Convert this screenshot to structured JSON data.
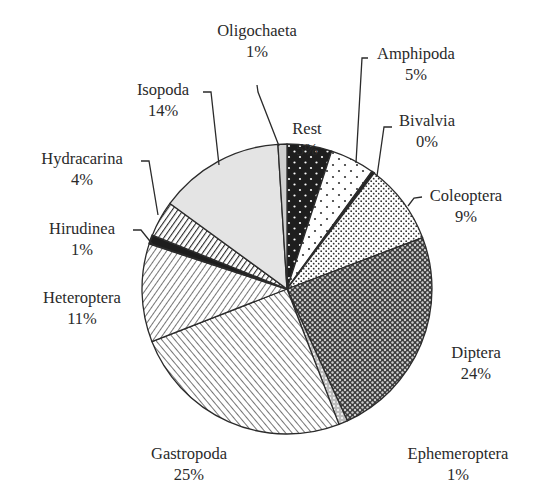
{
  "chart_data": {
    "type": "pie",
    "title": "",
    "start_angle_deg": 0,
    "direction": "clockwise",
    "center": [
      287,
      289
    ],
    "radius": 145,
    "slices": [
      {
        "name": "Rest",
        "value": 5,
        "label": "Rest",
        "pct": "5%",
        "pattern": "black-dots",
        "label_pos": [
          307,
          118
        ],
        "leader": []
      },
      {
        "name": "Amphipoda",
        "value": 5,
        "label": "Amphipoda",
        "pct": "5%",
        "pattern": "white-dots",
        "label_pos": [
          416,
          43
        ],
        "leader": [
          [
            368,
            58
          ],
          [
            362,
            58
          ],
          [
            356,
            163
          ]
        ]
      },
      {
        "name": "Bivalvia",
        "value": 0.3,
        "label": "Bivalvia",
        "pct": "0%",
        "pattern": "dark",
        "label_pos": [
          427,
          110
        ],
        "leader": [
          [
            392,
            127
          ],
          [
            384,
            127
          ],
          [
            377,
            176
          ]
        ]
      },
      {
        "name": "Coleoptera",
        "value": 9,
        "label": "Coleoptera",
        "pct": "9%",
        "pattern": "fine-dots",
        "label_pos": [
          466,
          185
        ],
        "leader": [
          [
            422,
            197
          ],
          [
            414,
            198
          ],
          [
            408,
            206
          ]
        ]
      },
      {
        "name": "Diptera",
        "value": 24,
        "label": "Diptera",
        "pct": "24%",
        "pattern": "dark-cross",
        "label_pos": [
          476,
          342
        ],
        "leader": []
      },
      {
        "name": "Ephemeroptera",
        "value": 1,
        "label": "Ephemeroptera",
        "pct": "1%",
        "pattern": "light-cross",
        "label_pos": [
          458,
          443
        ],
        "leader": []
      },
      {
        "name": "Gastropoda",
        "value": 25,
        "label": "Gastropoda",
        "pct": "25%",
        "pattern": "diag-down",
        "label_pos": [
          189,
          443
        ],
        "leader": []
      },
      {
        "name": "Heteroptera",
        "value": 11,
        "label": "Heteroptera",
        "pct": "11%",
        "pattern": "diag-up",
        "label_pos": [
          82,
          287
        ],
        "leader": []
      },
      {
        "name": "Hirudinea",
        "value": 1,
        "label": "Hirudinea",
        "pct": "1%",
        "pattern": "dark",
        "label_pos": [
          82,
          218
        ],
        "leader": [
          [
            133,
            230
          ],
          [
            141,
            230
          ],
          [
            153,
            245
          ]
        ]
      },
      {
        "name": "Hydracarina",
        "value": 4,
        "label": "Hydracarina",
        "pct": "4%",
        "pattern": "diag-up-dense",
        "label_pos": [
          82,
          148
        ],
        "leader": [
          [
            141,
            161
          ],
          [
            149,
            161
          ],
          [
            158,
            215
          ]
        ]
      },
      {
        "name": "Isopoda",
        "value": 14,
        "label": "Isopoda",
        "pct": "14%",
        "pattern": "light-gray",
        "label_pos": [
          163,
          79
        ],
        "leader": [
          [
            203,
            92
          ],
          [
            211,
            92
          ],
          [
            219,
            165
          ]
        ]
      },
      {
        "name": "Oligochaeta",
        "value": 1,
        "label": "Oligochaeta",
        "pct": "1%",
        "pattern": "gray-line",
        "label_pos": [
          257,
          20
        ],
        "leader": [
          [
            257,
            85
          ],
          [
            258,
            92
          ],
          [
            279,
            146
          ]
        ]
      }
    ],
    "colors": {
      "outline": "#2b2b2b",
      "black": "#1e1e1e",
      "light_gray": "#e4e4e4",
      "text": "#2a2a2a"
    },
    "legend": "none"
  }
}
